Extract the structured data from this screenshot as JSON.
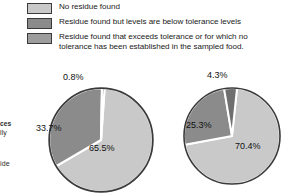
{
  "figure": {
    "bleed_text": {
      "line1": "ces",
      "line2": "lly",
      "line3": "ide"
    },
    "legend": {
      "items": [
        {
          "swatch_color": "#c9c9c9",
          "label": "No residue found",
          "label_line2": ""
        },
        {
          "swatch_color": "#8b8b8b",
          "label": "Residue found but levels are below tolerance levels",
          "label_line2": ""
        },
        {
          "swatch_color": "#9d9d9d",
          "label": "Residue found that exceeds tolerance or for which no",
          "label_line2": "tolerance has been established in the sampled food."
        }
      ]
    }
  },
  "chart_data": [
    {
      "type": "pie",
      "name": "left-pie",
      "title": "",
      "categories": [
        "No residue found",
        "Residue found but levels are below tolerance levels",
        "Residue found that exceeds tolerance or for which no tolerance has been established in the sampled food."
      ],
      "values": [
        65.5,
        33.7,
        0.8
      ],
      "labels": [
        "65.5%",
        "33.7%",
        "0.8%"
      ],
      "colors": [
        "#c9c9c9",
        "#8b8b8b",
        "#6f6f6f"
      ],
      "units": "percent",
      "legend": "top"
    },
    {
      "type": "pie",
      "name": "right-pie",
      "title": "",
      "categories": [
        "No residue found",
        "Residue found but levels are below tolerance levels",
        "Residue found that exceeds tolerance or for which no tolerance has been established in the sampled food."
      ],
      "values": [
        70.4,
        25.3,
        4.3
      ],
      "labels": [
        "70.4%",
        "25.3%",
        "4.3%"
      ],
      "colors": [
        "#c9c9c9",
        "#8b8b8b",
        "#6f6f6f"
      ],
      "units": "percent",
      "legend": "top"
    }
  ]
}
